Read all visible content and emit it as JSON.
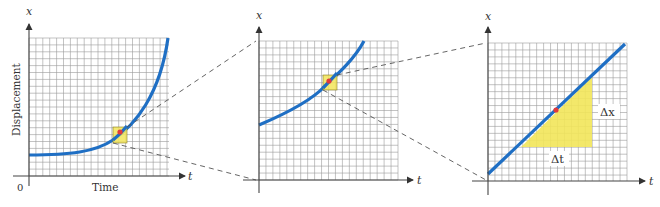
{
  "figure": {
    "colors": {
      "curve": "#1f6fc4",
      "highlight_fill": "#f2e55a",
      "point": "#e0393b",
      "grid": "#9a9a9a",
      "axis": "#444444"
    },
    "panels": [
      {
        "id": "panel-1",
        "y_axis_symbol": "x",
        "x_axis_symbol": "t",
        "y_axis_title": "Displacement",
        "x_axis_title": "Time",
        "origin_label": "0",
        "curve": "exponential-like increasing",
        "highlight": "small yellow square around red point on curve"
      },
      {
        "id": "panel-2",
        "y_axis_symbol": "x",
        "x_axis_symbol": "t",
        "curve": "gently curving increasing (magnified view)",
        "highlight": "small yellow square around red point on curve"
      },
      {
        "id": "panel-3",
        "y_axis_symbol": "x",
        "x_axis_symbol": "t",
        "curve": "straight line (further magnified)",
        "triangle_labels": {
          "rise": "Δx",
          "run": "Δt"
        }
      }
    ]
  }
}
